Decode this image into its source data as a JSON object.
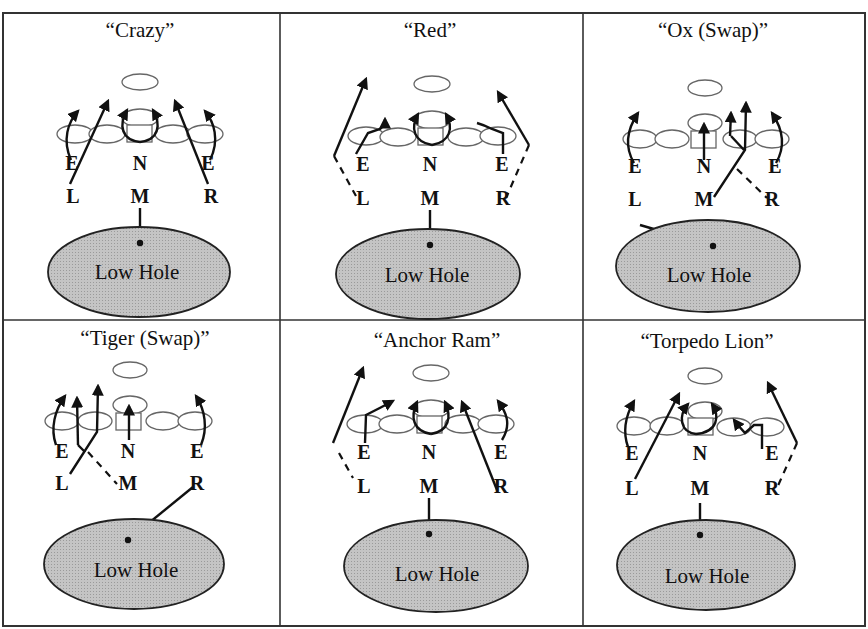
{
  "figure": {
    "panels": [
      {
        "title": "“Crazy”",
        "labels": {
          "e_left": "E",
          "n": "N",
          "e_right": "E",
          "l": "L",
          "m": "M",
          "r": "R"
        },
        "hole": "Low Hole"
      },
      {
        "title": "“Red”",
        "labels": {
          "e_left": "E",
          "n": "N",
          "e_right": "E",
          "l": "L",
          "m": "M",
          "r": "R"
        },
        "hole": "Low Hole"
      },
      {
        "title": "“Ox (Swap)”",
        "labels": {
          "e_left": "E",
          "n": "N",
          "e_right": "E",
          "l": "L",
          "m": "M",
          "r": "R"
        },
        "hole": "Low Hole"
      },
      {
        "title": "“Tiger (Swap)”",
        "labels": {
          "e_left": "E",
          "n": "N",
          "e_right": "E",
          "l": "L",
          "m": "M",
          "r": "R"
        },
        "hole": "Low Hole"
      },
      {
        "title": "“Anchor Ram”",
        "labels": {
          "e_left": "E",
          "n": "N",
          "e_right": "E",
          "l": "L",
          "m": "M",
          "r": "R"
        },
        "hole": "Low Hole"
      },
      {
        "title": "“Torpedo Lion”",
        "labels": {
          "e_left": "E",
          "n": "N",
          "e_right": "E",
          "l": "L",
          "m": "M",
          "r": "R"
        },
        "hole": "Low Hole"
      }
    ]
  }
}
